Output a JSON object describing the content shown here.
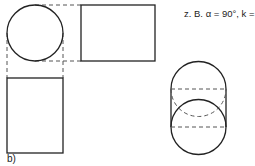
{
  "caption": {
    "prefix": "z. B. α = 90°, k =",
    "k_numerator": "1",
    "k_denominator": "2"
  },
  "figure_label": "b)",
  "colors": {
    "stroke": "#222222",
    "dashed": "#555555"
  }
}
